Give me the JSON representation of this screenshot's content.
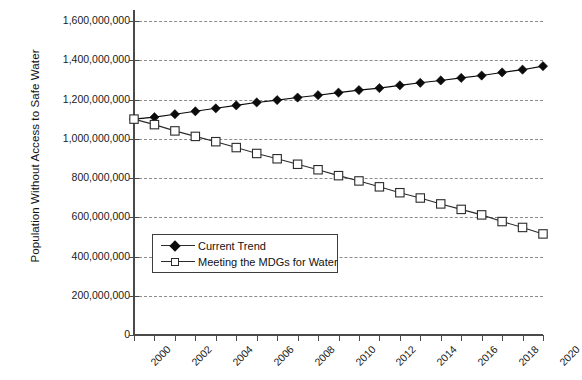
{
  "chart_data": {
    "type": "line",
    "title": "",
    "xlabel": "",
    "ylabel": "Population Without Access to Safe Water",
    "xlim": [
      2000,
      2020
    ],
    "ylim": [
      0,
      1600000000
    ],
    "grid": true,
    "legend_position": "inside-lower-left",
    "x": [
      2000,
      2001,
      2002,
      2003,
      2004,
      2005,
      2006,
      2007,
      2008,
      2009,
      2010,
      2011,
      2012,
      2013,
      2014,
      2015,
      2016,
      2017,
      2018,
      2019,
      2020
    ],
    "ytick_labels": [
      "1,600,000,000",
      "1,400,000,000",
      "1,200,000,000",
      "1,000,000,000",
      "800,000,000",
      "600,000,000",
      "400,000,000",
      "200,000,000",
      "0"
    ],
    "ytick_values": [
      1600000000,
      1400000000,
      1200000000,
      1000000000,
      800000000,
      600000000,
      400000000,
      200000000,
      0
    ],
    "xtick_labels": [
      "2000",
      "2002",
      "2004",
      "2006",
      "2008",
      "2010",
      "2012",
      "2014",
      "2016",
      "2018",
      "2020"
    ],
    "xtick_values": [
      2000,
      2002,
      2004,
      2006,
      2008,
      2010,
      2012,
      2014,
      2016,
      2018,
      2020
    ],
    "series": [
      {
        "name": "Current Trend",
        "marker": "filled-diamond",
        "color": "#0b0b0b",
        "values": [
          1100000000,
          1110000000,
          1125000000,
          1140000000,
          1155000000,
          1170000000,
          1185000000,
          1197000000,
          1210000000,
          1222000000,
          1235000000,
          1248000000,
          1258000000,
          1272000000,
          1285000000,
          1297000000,
          1310000000,
          1322000000,
          1338000000,
          1352000000,
          1370000000
        ]
      },
      {
        "name": "Meeting the MDGs for Water",
        "marker": "open-square",
        "color": "#2b2b2b",
        "values": [
          1100000000,
          1072000000,
          1040000000,
          1012000000,
          985000000,
          955000000,
          925000000,
          898000000,
          870000000,
          842000000,
          812000000,
          785000000,
          755000000,
          725000000,
          698000000,
          668000000,
          640000000,
          612000000,
          578000000,
          548000000,
          515000000
        ]
      }
    ]
  },
  "legend": {
    "items": [
      {
        "label": "Current Trend",
        "marker": "filled-diamond"
      },
      {
        "label": "Meeting the MDGs for Water",
        "marker": "open-square"
      }
    ]
  }
}
